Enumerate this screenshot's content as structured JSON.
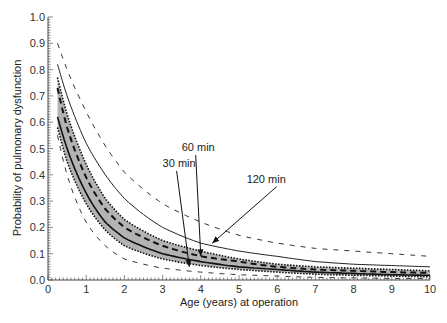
{
  "chart_data": {
    "type": "line",
    "title": "",
    "xlabel": "Age (years) at operation",
    "ylabel": "Probability of pulmonary dysfunction",
    "xlim": [
      0,
      10
    ],
    "ylim": [
      0.0,
      1.0
    ],
    "x_ticks": [
      "0",
      "1",
      "2",
      "3",
      "4",
      "5",
      "6",
      "7",
      "8",
      "9",
      "10"
    ],
    "y_ticks": [
      "0.0",
      "0.1",
      "0.2",
      "0.3",
      "0.4",
      "0.5",
      "0.6",
      "0.7",
      "0.8",
      "0.9",
      "1.0"
    ],
    "grid": false,
    "legend": null,
    "x": [
      0.25,
      0.5,
      1,
      1.5,
      2,
      3,
      4,
      5,
      6,
      7,
      8,
      9,
      10
    ],
    "series": [
      {
        "name": "120 min upper confidence limit",
        "style": "dashed",
        "values": [
          0.9,
          0.8,
          0.64,
          0.51,
          0.41,
          0.29,
          0.22,
          0.17,
          0.14,
          0.12,
          0.11,
          0.1,
          0.09
        ]
      },
      {
        "name": "120 min",
        "style": "solid-thin",
        "values": [
          0.82,
          0.7,
          0.52,
          0.4,
          0.31,
          0.2,
          0.14,
          0.11,
          0.09,
          0.07,
          0.06,
          0.055,
          0.05
        ]
      },
      {
        "name": "Shaded band upper (dotted)",
        "style": "dotted",
        "values": [
          0.77,
          0.63,
          0.44,
          0.31,
          0.23,
          0.15,
          0.11,
          0.08,
          0.06,
          0.05,
          0.045,
          0.04,
          0.035
        ]
      },
      {
        "name": "60 min",
        "style": "dashed-thick",
        "values": [
          0.73,
          0.58,
          0.39,
          0.27,
          0.2,
          0.13,
          0.09,
          0.07,
          0.05,
          0.04,
          0.035,
          0.03,
          0.027
        ]
      },
      {
        "name": "30 min",
        "style": "solid-thick",
        "values": [
          0.62,
          0.5,
          0.33,
          0.22,
          0.16,
          0.1,
          0.07,
          0.05,
          0.04,
          0.03,
          0.025,
          0.02,
          0.018
        ]
      },
      {
        "name": "Shaded band lower (dotted)",
        "style": "dotted",
        "values": [
          0.58,
          0.45,
          0.29,
          0.19,
          0.13,
          0.08,
          0.055,
          0.04,
          0.03,
          0.022,
          0.018,
          0.015,
          0.012
        ]
      },
      {
        "name": "30 min lower confidence limit",
        "style": "dashed",
        "values": [
          0.55,
          0.4,
          0.22,
          0.13,
          0.08,
          0.045,
          0.03,
          0.02,
          0.015,
          0.01,
          0.008,
          0.006,
          0.005
        ]
      }
    ],
    "annotations": [
      {
        "text": "30 min",
        "label_xy": [
          3.0,
          0.43
        ],
        "arrow_to": [
          3.7,
          0.05
        ]
      },
      {
        "text": "60 min",
        "label_xy": [
          3.5,
          0.49
        ],
        "arrow_to": [
          4.0,
          0.09
        ]
      },
      {
        "text": "120 min",
        "label_xy": [
          5.2,
          0.37
        ],
        "arrow_to": [
          4.3,
          0.14
        ]
      }
    ]
  }
}
